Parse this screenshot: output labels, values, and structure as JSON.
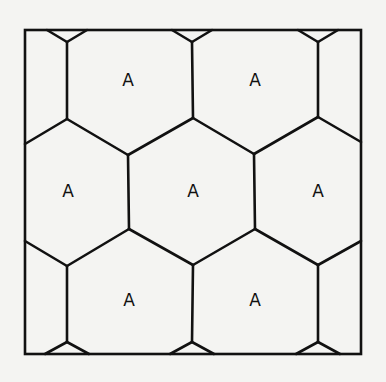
{
  "diagram": {
    "type": "hexagonal-tiling",
    "frame": {
      "x": 25,
      "y": 30,
      "width": 336,
      "height": 324
    },
    "colors": {
      "background": "#f4f4f2",
      "line": "#111111"
    },
    "cells": [
      {
        "label": "A",
        "x": 128,
        "y": 80
      },
      {
        "label": "A",
        "x": 255,
        "y": 80
      },
      {
        "label": "A",
        "x": 68,
        "y": 191
      },
      {
        "label": "A",
        "x": 193,
        "y": 191
      },
      {
        "label": "A",
        "x": 318,
        "y": 191
      },
      {
        "label": "A",
        "x": 129,
        "y": 300
      },
      {
        "label": "A",
        "x": 255,
        "y": 300
      }
    ],
    "edges": [
      [
        [
          47,
          30
        ],
        [
          67,
          42
        ]
      ],
      [
        [
          67,
          42
        ],
        [
          87,
          30
        ]
      ],
      [
        [
          67,
          42
        ],
        [
          67,
          119
        ]
      ],
      [
        [
          172,
          30
        ],
        [
          192,
          42
        ]
      ],
      [
        [
          192,
          42
        ],
        [
          212,
          30
        ]
      ],
      [
        [
          192,
          42
        ],
        [
          193,
          118
        ]
      ],
      [
        [
          298,
          30
        ],
        [
          318,
          42
        ]
      ],
      [
        [
          318,
          42
        ],
        [
          338,
          30
        ]
      ],
      [
        [
          318,
          42
        ],
        [
          318,
          117
        ]
      ],
      [
        [
          25,
          144
        ],
        [
          67,
          119
        ]
      ],
      [
        [
          67,
          119
        ],
        [
          128,
          155
        ]
      ],
      [
        [
          128,
          155
        ],
        [
          193,
          118
        ]
      ],
      [
        [
          193,
          118
        ],
        [
          254,
          154
        ]
      ],
      [
        [
          254,
          154
        ],
        [
          318,
          117
        ]
      ],
      [
        [
          318,
          117
        ],
        [
          361,
          142
        ]
      ],
      [
        [
          128,
          155
        ],
        [
          129,
          229
        ]
      ],
      [
        [
          254,
          154
        ],
        [
          255,
          229
        ]
      ],
      [
        [
          25,
          241
        ],
        [
          67,
          266
        ]
      ],
      [
        [
          67,
          266
        ],
        [
          129,
          229
        ]
      ],
      [
        [
          129,
          229
        ],
        [
          193,
          265
        ]
      ],
      [
        [
          193,
          265
        ],
        [
          255,
          229
        ]
      ],
      [
        [
          255,
          229
        ],
        [
          318,
          265
        ]
      ],
      [
        [
          318,
          265
        ],
        [
          361,
          241
        ]
      ],
      [
        [
          67,
          266
        ],
        [
          67,
          342
        ]
      ],
      [
        [
          193,
          265
        ],
        [
          192,
          342
        ]
      ],
      [
        [
          318,
          265
        ],
        [
          318,
          342
        ]
      ],
      [
        [
          45,
          354
        ],
        [
          67,
          342
        ]
      ],
      [
        [
          67,
          342
        ],
        [
          89,
          354
        ]
      ],
      [
        [
          170,
          354
        ],
        [
          192,
          342
        ]
      ],
      [
        [
          192,
          342
        ],
        [
          214,
          354
        ]
      ],
      [
        [
          296,
          354
        ],
        [
          318,
          342
        ]
      ],
      [
        [
          318,
          342
        ],
        [
          340,
          354
        ]
      ]
    ]
  }
}
